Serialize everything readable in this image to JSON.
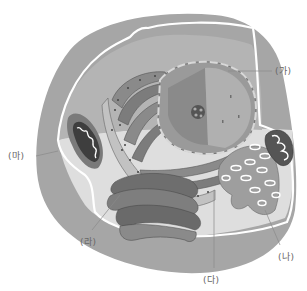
{
  "diagram": {
    "colors": {
      "background": "#ffffff",
      "outer_cytoplasm": "#a4a4a4",
      "inner_floor": "#dcdcdc",
      "membrane": "#ffffff",
      "nucleus": "#8c8c8c",
      "er": "#7a7a7a",
      "leader_line": "#8a8a8a",
      "label_text": "#666666"
    },
    "labels": [
      {
        "id": "ga",
        "text": "(가)",
        "points_to": "nucleus"
      },
      {
        "id": "na",
        "text": "(나)",
        "points_to": "smooth-er"
      },
      {
        "id": "da",
        "text": "(다)",
        "points_to": "rough-er"
      },
      {
        "id": "ra",
        "text": "(라)",
        "points_to": "golgi"
      },
      {
        "id": "ma",
        "text": "(마)",
        "points_to": "mitochondrion"
      }
    ]
  }
}
